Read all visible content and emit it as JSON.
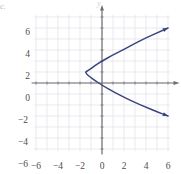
{
  "figure": {
    "corner_mark": "c.",
    "axis_label_y": "y",
    "axis_label_x": "x"
  },
  "chart_data": {
    "type": "line",
    "title": "",
    "subtitle": "",
    "xlabel": "x",
    "ylabel": "y",
    "xlim": [
      -7,
      7
    ],
    "ylim": [
      -7,
      7
    ],
    "grid": true,
    "legend": false,
    "grid_step": 1,
    "grid_color": "#dcdce6",
    "axis_color": "#6f6f73",
    "curve_color": "#3a4480",
    "curve_description": "Sideways parabola opening to the right with vertex at (-1.5, 1); arrowheads at both ends",
    "vertex": [
      -1.5,
      1
    ],
    "opens": "right",
    "x_ticks": [
      -6,
      -4,
      -2,
      0,
      2,
      4,
      6
    ],
    "x_tick_labels": [
      "−6",
      "−4",
      "−2",
      "0",
      "2",
      "4",
      "6"
    ],
    "y_ticks": [
      -6,
      -4,
      -2,
      0,
      2,
      4,
      6
    ],
    "y_tick_labels": [
      "−6",
      "−4",
      "−2",
      "0",
      "2",
      "4",
      "6"
    ],
    "series": [
      {
        "name": "parabola",
        "color": "#3a4480",
        "points": [
          [
            6.0,
            5.0
          ],
          [
            5.0,
            4.55
          ],
          [
            4.0,
            4.1
          ],
          [
            3.0,
            3.6
          ],
          [
            2.0,
            3.05
          ],
          [
            1.0,
            2.55
          ],
          [
            0.0,
            2.0
          ],
          [
            -0.6,
            1.6
          ],
          [
            -1.1,
            1.25
          ],
          [
            -1.4,
            1.05
          ],
          [
            -1.5,
            1.0
          ],
          [
            -1.4,
            0.82
          ],
          [
            -1.1,
            0.55
          ],
          [
            -0.6,
            0.2
          ],
          [
            0.0,
            -0.2
          ],
          [
            1.0,
            -0.78
          ],
          [
            2.0,
            -1.3
          ],
          [
            3.0,
            -1.78
          ],
          [
            4.0,
            -2.2
          ],
          [
            5.0,
            -2.62
          ],
          [
            6.0,
            -3.0
          ]
        ]
      }
    ]
  }
}
